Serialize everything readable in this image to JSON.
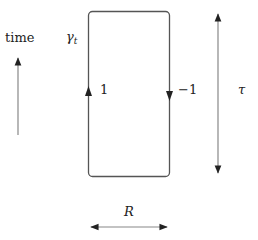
{
  "diagram": {
    "time_label": "time",
    "curve_label": "γ",
    "curve_subscript": "t",
    "left_edge_label": "1",
    "right_edge_label": "−1",
    "height_label": "τ",
    "width_label": "R"
  },
  "colors": {
    "stroke": "#555555",
    "arrowhead": "#222222",
    "text": "#222222"
  }
}
